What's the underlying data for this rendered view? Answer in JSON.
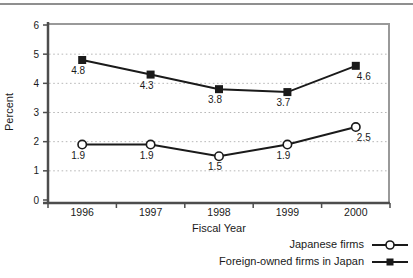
{
  "chart_data": {
    "type": "line",
    "title": "",
    "xlabel": "Fiscal Year",
    "ylabel": "Percent",
    "categories": [
      "1996",
      "1997",
      "1998",
      "1999",
      "2000"
    ],
    "ylim": [
      0,
      6
    ],
    "yticks": [
      0,
      1,
      2,
      3,
      4,
      5,
      6
    ],
    "grid": "horizontal-dotted",
    "data_labels": true,
    "legend_position": "bottom-right",
    "colors": {
      "line": "#1a1a1a",
      "axis": "#4d4d4d",
      "box": "#999999",
      "grid": "#b8b8b8",
      "text": "#1a1a1a",
      "top_rule": "#8f8f8f",
      "background": "#ffffff"
    },
    "series": [
      {
        "name": "Japanese firms",
        "marker": "open-circle",
        "values": [
          1.9,
          1.9,
          1.5,
          1.9,
          2.5
        ]
      },
      {
        "name": "Foreign-owned firms in Japan",
        "marker": "filled-square",
        "values": [
          4.8,
          4.3,
          3.8,
          3.7,
          4.6
        ]
      }
    ]
  }
}
